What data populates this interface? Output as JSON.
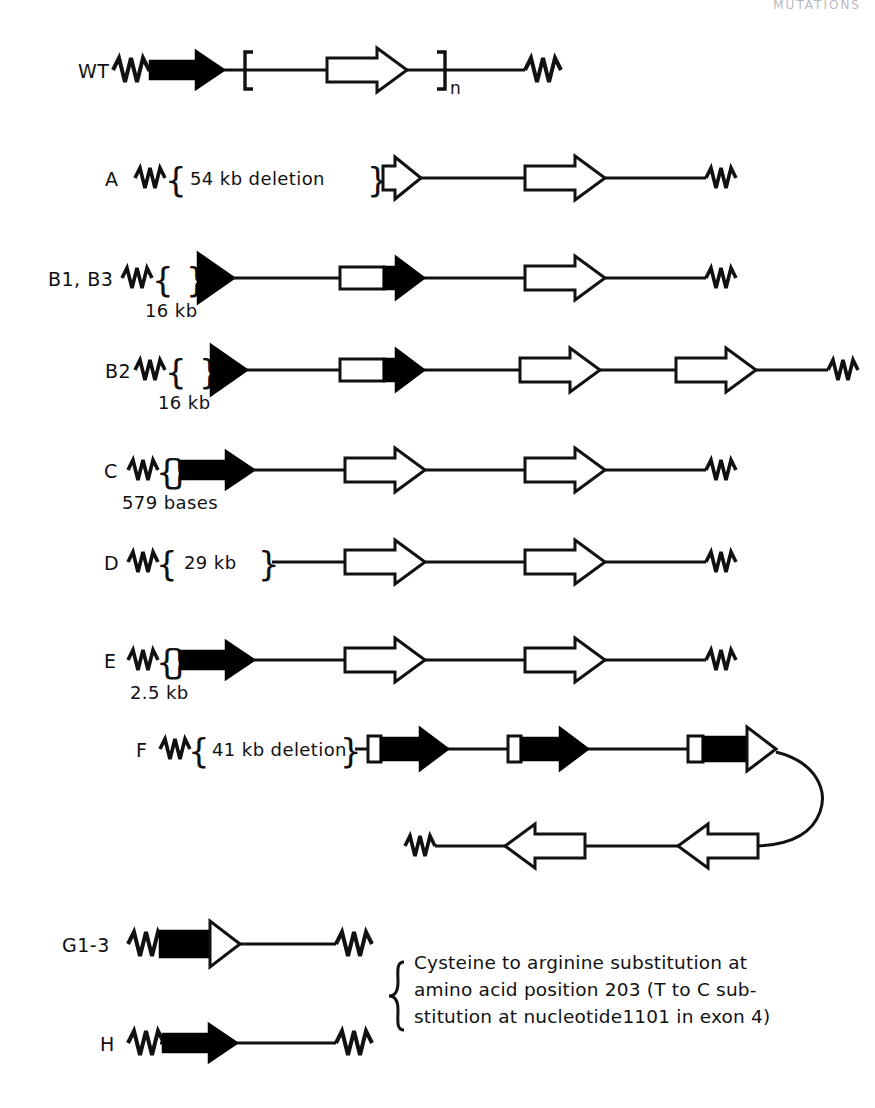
{
  "figure": {
    "title_cut_off": "MUTATIONS",
    "rows": [
      {
        "id": "WT",
        "label": "WT",
        "size_label": "",
        "inline_label": "",
        "bracket_subscript": "n",
        "description": "wild type allele: 5' squiggle, filled black arrow, intervening line, bracketed open arrow repeated n times, 3' squiggle"
      },
      {
        "id": "A",
        "label": "A",
        "size_label": "",
        "inline_label": "54 kb deletion",
        "bracket_subscript": "",
        "description": "54 kb deletion removing the black arrow; truncated open arrow then full open arrow"
      },
      {
        "id": "B1B3",
        "label": "B1, B3",
        "size_label": "16 kb",
        "inline_label": "",
        "bracket_subscript": "",
        "description": "16 kb deletion; truncated black arrowhead, hybrid open/black arrow, open arrow"
      },
      {
        "id": "B2",
        "label": "B2",
        "size_label": "16 kb",
        "inline_label": "",
        "bracket_subscript": "",
        "description": "16 kb deletion; truncated black arrowhead, hybrid open/black arrow, two open arrows"
      },
      {
        "id": "C",
        "label": "C",
        "size_label": "579 bases",
        "inline_label": "",
        "bracket_subscript": "",
        "description": "579 base deletion; full black arrow then two open arrows"
      },
      {
        "id": "D",
        "label": "D",
        "size_label": "",
        "inline_label": "29 kb",
        "bracket_subscript": "",
        "description": "29 kb deletion removing the black arrow; two open arrows"
      },
      {
        "id": "E",
        "label": "E",
        "size_label": "2.5 kb",
        "inline_label": "",
        "bracket_subscript": "",
        "description": "2.5 kb deletion; full black arrow then two open arrows"
      },
      {
        "id": "F",
        "label": "F",
        "size_label": "",
        "inline_label": "41 kb deletion",
        "bracket_subscript": "",
        "description": "41 kb deletion; three boxed-tail arrows, last with open head, looping round to an inverted lower strand with two left-pointing open arrows"
      },
      {
        "id": "G1-3",
        "label": "G1-3",
        "size_label": "",
        "inline_label": "",
        "bracket_subscript": "",
        "description": "black body arrow with open arrowhead"
      },
      {
        "id": "H",
        "label": "H",
        "size_label": "",
        "inline_label": "",
        "bracket_subscript": "",
        "description": "intact black arrow"
      }
    ],
    "annotation": {
      "line1": "Cysteine to arginine substitution at",
      "line2": "amino acid position 203 (T to C sub-",
      "line3": "stitution at nucleotide1101 in exon 4)"
    },
    "colors": {
      "ink": "#111111",
      "paper": "#ffffff",
      "fill_solid": "#000000",
      "fill_open": "#ffffff"
    }
  }
}
